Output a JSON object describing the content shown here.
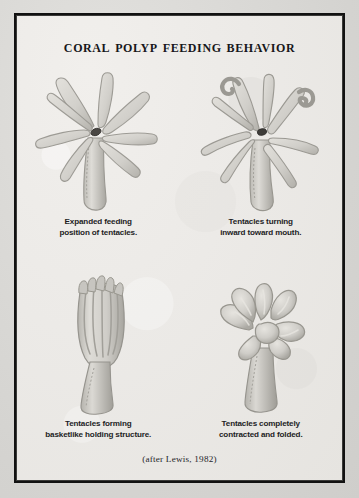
{
  "plate": {
    "title": "Coral Polyp Feeding Behavior",
    "attribution": "(after Lewis, 1982)",
    "frame_color": "#111111",
    "paper_color": "#eceae7",
    "ink_color": "#1d1d1f",
    "figure_fill": "#cfcdc8",
    "figure_shade": "#a9a7a1",
    "figure_highlight": "#e4e2dd",
    "mouth_color": "#4a4744"
  },
  "figures": [
    {
      "id": "polyp-expanded",
      "position": "top-left",
      "caption_line1": "Expanded feeding",
      "caption_line2": "position of tentacles.",
      "state": "expanded",
      "tentacle_count": 8,
      "mouth_visible": true
    },
    {
      "id": "polyp-turning-inward",
      "position": "top-right",
      "caption_line1": "Tentacles turning",
      "caption_line2": "inward toward mouth.",
      "state": "turning-inward",
      "tentacle_count": 8,
      "mouth_visible": true
    },
    {
      "id": "polyp-basket",
      "position": "bottom-left",
      "caption_line1": "Tentacles forming",
      "caption_line2": "basketlike holding structure.",
      "state": "basket",
      "tentacle_count": 8,
      "mouth_visible": false
    },
    {
      "id": "polyp-contracted",
      "position": "bottom-right",
      "caption_line1": "Tentacles completely",
      "caption_line2": "contracted and folded.",
      "state": "contracted",
      "tentacle_count": 8,
      "mouth_visible": false
    }
  ]
}
